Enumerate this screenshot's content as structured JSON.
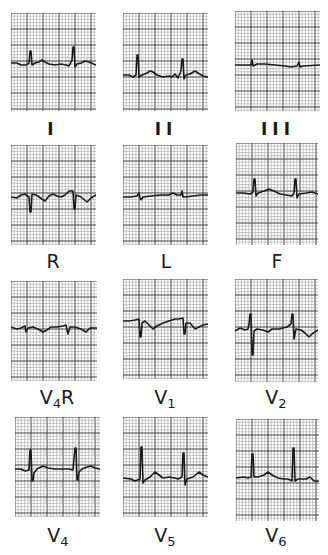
{
  "chart_data": {
    "type": "line",
    "title": "",
    "grid": {
      "on": true,
      "major_every_px": 16,
      "minor_divisions": 5,
      "paper_color": "#ffffff",
      "line_color": "#555555"
    },
    "layout": {
      "columns": 3,
      "rows": 4
    },
    "leads": [
      {
        "id": "I",
        "label": "I",
        "label_main": "I",
        "label_sub": "",
        "label_tail": "",
        "box": [
          11,
          13,
          85,
          98
        ],
        "baseline": 50,
        "trace": [
          [
            0,
            50
          ],
          [
            6,
            50
          ],
          [
            10,
            52
          ],
          [
            15,
            52
          ],
          [
            18,
            50
          ],
          [
            19,
            38
          ],
          [
            20,
            38
          ],
          [
            21,
            52
          ],
          [
            24,
            50
          ],
          [
            28,
            49
          ],
          [
            31,
            47
          ],
          [
            34,
            49
          ],
          [
            38,
            51
          ],
          [
            44,
            52
          ],
          [
            50,
            51
          ],
          [
            55,
            52
          ],
          [
            58,
            53
          ],
          [
            61,
            47
          ],
          [
            62,
            34
          ],
          [
            63,
            34
          ],
          [
            64,
            54
          ],
          [
            66,
            51
          ],
          [
            70,
            50
          ],
          [
            74,
            48
          ],
          [
            78,
            49
          ],
          [
            85,
            52
          ]
        ]
      },
      {
        "id": "II",
        "label": "II",
        "label_main": "II",
        "label_sub": "",
        "label_tail": "",
        "box": [
          123,
          13,
          85,
          98
        ],
        "baseline": 58,
        "trace": [
          [
            0,
            62
          ],
          [
            6,
            62
          ],
          [
            10,
            64
          ],
          [
            13,
            62
          ],
          [
            14,
            42
          ],
          [
            15,
            42
          ],
          [
            16,
            64
          ],
          [
            19,
            62
          ],
          [
            24,
            60
          ],
          [
            27,
            58
          ],
          [
            30,
            59
          ],
          [
            34,
            62
          ],
          [
            40,
            64
          ],
          [
            46,
            63
          ],
          [
            49,
            64
          ],
          [
            52,
            61
          ],
          [
            55,
            65
          ],
          [
            58,
            58
          ],
          [
            59,
            46
          ],
          [
            60,
            46
          ],
          [
            61,
            66
          ],
          [
            63,
            62
          ],
          [
            67,
            61
          ],
          [
            72,
            58
          ],
          [
            75,
            60
          ],
          [
            80,
            63
          ],
          [
            85,
            64
          ]
        ]
      },
      {
        "id": "III",
        "label": "III",
        "label_main": "III",
        "label_sub": "",
        "label_tail": "",
        "box": [
          235,
          11,
          85,
          100
        ],
        "baseline": 54,
        "trace": [
          [
            0,
            54
          ],
          [
            12,
            54
          ],
          [
            16,
            54
          ],
          [
            17,
            49
          ],
          [
            18,
            55
          ],
          [
            22,
            53
          ],
          [
            30,
            53
          ],
          [
            40,
            54
          ],
          [
            50,
            55
          ],
          [
            56,
            56
          ],
          [
            62,
            55
          ],
          [
            64,
            51
          ],
          [
            65,
            56
          ],
          [
            68,
            55
          ],
          [
            85,
            54
          ]
        ]
      },
      {
        "id": "R",
        "label": "R",
        "label_main": "R",
        "label_sub": "",
        "label_tail": "",
        "box": [
          11,
          145,
          85,
          100
        ],
        "baseline": 52,
        "trace": [
          [
            0,
            52
          ],
          [
            6,
            53
          ],
          [
            10,
            50
          ],
          [
            14,
            49
          ],
          [
            18,
            52
          ],
          [
            19,
            67
          ],
          [
            20,
            67
          ],
          [
            21,
            49
          ],
          [
            25,
            50
          ],
          [
            28,
            52
          ],
          [
            34,
            56
          ],
          [
            38,
            51
          ],
          [
            42,
            49
          ],
          [
            46,
            51
          ],
          [
            50,
            52
          ],
          [
            54,
            50
          ],
          [
            58,
            46
          ],
          [
            62,
            46
          ],
          [
            63,
            64
          ],
          [
            64,
            64
          ],
          [
            65,
            50
          ],
          [
            70,
            52
          ],
          [
            76,
            57
          ],
          [
            80,
            53
          ],
          [
            85,
            50
          ]
        ]
      },
      {
        "id": "L",
        "label": "L",
        "label_main": "L",
        "label_sub": "",
        "label_tail": "",
        "box": [
          123,
          145,
          85,
          100
        ],
        "baseline": 51,
        "trace": [
          [
            0,
            52
          ],
          [
            8,
            52
          ],
          [
            14,
            51
          ],
          [
            16,
            48
          ],
          [
            17,
            53
          ],
          [
            18,
            55
          ],
          [
            20,
            52
          ],
          [
            28,
            51
          ],
          [
            38,
            50
          ],
          [
            46,
            50
          ],
          [
            50,
            48
          ],
          [
            54,
            50
          ],
          [
            58,
            50
          ],
          [
            59,
            46
          ],
          [
            60,
            52
          ],
          [
            62,
            52
          ],
          [
            70,
            51
          ],
          [
            78,
            50
          ],
          [
            85,
            50
          ]
        ]
      },
      {
        "id": "F",
        "label": "F",
        "label_main": "F",
        "label_sub": "",
        "label_tail": "",
        "box": [
          236,
          143,
          82,
          102
        ],
        "baseline": 50,
        "trace": [
          [
            0,
            50
          ],
          [
            8,
            50
          ],
          [
            14,
            51
          ],
          [
            17,
            49
          ],
          [
            18,
            36
          ],
          [
            19,
            36
          ],
          [
            20,
            53
          ],
          [
            22,
            50
          ],
          [
            28,
            48
          ],
          [
            33,
            46
          ],
          [
            38,
            48
          ],
          [
            44,
            51
          ],
          [
            50,
            52
          ],
          [
            56,
            53
          ],
          [
            58,
            50
          ],
          [
            59,
            36
          ],
          [
            60,
            36
          ],
          [
            61,
            55
          ],
          [
            63,
            51
          ],
          [
            70,
            50
          ],
          [
            76,
            49
          ],
          [
            82,
            51
          ]
        ]
      },
      {
        "id": "V4R",
        "label": "V4R",
        "label_main": "V",
        "label_sub": "4",
        "label_tail": "R",
        "box": [
          11,
          281,
          86,
          100
        ],
        "baseline": 46,
        "trace": [
          [
            0,
            46
          ],
          [
            6,
            48
          ],
          [
            10,
            47
          ],
          [
            14,
            45
          ],
          [
            15,
            51
          ],
          [
            17,
            47
          ],
          [
            22,
            46
          ],
          [
            27,
            48
          ],
          [
            32,
            51
          ],
          [
            36,
            49
          ],
          [
            40,
            46
          ],
          [
            46,
            46
          ],
          [
            52,
            45
          ],
          [
            55,
            44
          ],
          [
            57,
            53
          ],
          [
            59,
            46
          ],
          [
            64,
            46
          ],
          [
            70,
            48
          ],
          [
            75,
            51
          ],
          [
            79,
            47
          ],
          [
            86,
            47
          ]
        ]
      },
      {
        "id": "V1",
        "label": "V1",
        "label_main": "V",
        "label_sub": "1",
        "label_tail": "",
        "box": [
          123,
          279,
          85,
          100
        ],
        "baseline": 40,
        "trace": [
          [
            0,
            42
          ],
          [
            6,
            42
          ],
          [
            12,
            41
          ],
          [
            16,
            40
          ],
          [
            17,
            58
          ],
          [
            18,
            58
          ],
          [
            19,
            44
          ],
          [
            22,
            42
          ],
          [
            26,
            46
          ],
          [
            30,
            50
          ],
          [
            34,
            47
          ],
          [
            40,
            44
          ],
          [
            46,
            42
          ],
          [
            52,
            40
          ],
          [
            56,
            40
          ],
          [
            60,
            39
          ],
          [
            61,
            55
          ],
          [
            62,
            55
          ],
          [
            63,
            44
          ],
          [
            67,
            44
          ],
          [
            72,
            50
          ],
          [
            76,
            48
          ],
          [
            80,
            46
          ],
          [
            85,
            45
          ]
        ]
      },
      {
        "id": "V2",
        "label": "V2",
        "label_main": "V",
        "label_sub": "2",
        "label_tail": "",
        "box": [
          235,
          279,
          83,
          103
        ],
        "baseline": 50,
        "trace": [
          [
            0,
            52
          ],
          [
            5,
            49
          ],
          [
            10,
            51
          ],
          [
            13,
            50
          ],
          [
            14,
            45
          ],
          [
            15,
            35
          ],
          [
            16,
            35
          ],
          [
            17,
            76
          ],
          [
            18,
            76
          ],
          [
            19,
            52
          ],
          [
            22,
            50
          ],
          [
            28,
            51
          ],
          [
            33,
            53
          ],
          [
            37,
            50
          ],
          [
            44,
            50
          ],
          [
            52,
            48
          ],
          [
            56,
            45
          ],
          [
            57,
            35
          ],
          [
            58,
            35
          ],
          [
            59,
            60
          ],
          [
            61,
            50
          ],
          [
            66,
            51
          ],
          [
            70,
            54
          ],
          [
            74,
            58
          ],
          [
            77,
            55
          ],
          [
            83,
            51
          ]
        ]
      },
      {
        "id": "V4",
        "label": "V4",
        "label_main": "V",
        "label_sub": "4",
        "label_tail": "",
        "box": [
          15,
          417,
          85,
          100
        ],
        "baseline": 51,
        "trace": [
          [
            0,
            52
          ],
          [
            6,
            52
          ],
          [
            10,
            54
          ],
          [
            14,
            53
          ],
          [
            15,
            33
          ],
          [
            16,
            33
          ],
          [
            17,
            64
          ],
          [
            18,
            64
          ],
          [
            19,
            56
          ],
          [
            22,
            52
          ],
          [
            28,
            49
          ],
          [
            33,
            51
          ],
          [
            40,
            52
          ],
          [
            48,
            52
          ],
          [
            54,
            52
          ],
          [
            58,
            53
          ],
          [
            60,
            31
          ],
          [
            61,
            31
          ],
          [
            62,
            63
          ],
          [
            63,
            63
          ],
          [
            64,
            55
          ],
          [
            67,
            52
          ],
          [
            72,
            50
          ],
          [
            76,
            49
          ],
          [
            80,
            51
          ],
          [
            85,
            52
          ]
        ]
      },
      {
        "id": "V5",
        "label": "V5",
        "label_main": "V",
        "label_sub": "5",
        "label_tail": "",
        "box": [
          123,
          417,
          85,
          100
        ],
        "baseline": 60,
        "trace": [
          [
            0,
            61
          ],
          [
            8,
            62
          ],
          [
            12,
            64
          ],
          [
            17,
            62
          ],
          [
            18,
            30
          ],
          [
            19,
            30
          ],
          [
            20,
            66
          ],
          [
            22,
            63
          ],
          [
            27,
            60
          ],
          [
            32,
            55
          ],
          [
            36,
            58
          ],
          [
            40,
            61
          ],
          [
            46,
            60
          ],
          [
            52,
            61
          ],
          [
            55,
            62
          ],
          [
            59,
            60
          ],
          [
            60,
            36
          ],
          [
            61,
            36
          ],
          [
            62,
            68
          ],
          [
            64,
            62
          ],
          [
            70,
            60
          ],
          [
            76,
            55
          ],
          [
            80,
            58
          ],
          [
            85,
            60
          ]
        ]
      },
      {
        "id": "V6",
        "label": "V6",
        "label_main": "V",
        "label_sub": "6",
        "label_tail": "",
        "box": [
          236,
          419,
          83,
          102
        ],
        "baseline": 58,
        "trace": [
          [
            0,
            59
          ],
          [
            8,
            58
          ],
          [
            12,
            59
          ],
          [
            15,
            58
          ],
          [
            16,
            35
          ],
          [
            17,
            35
          ],
          [
            18,
            58
          ],
          [
            22,
            58
          ],
          [
            28,
            56
          ],
          [
            32,
            53
          ],
          [
            36,
            56
          ],
          [
            42,
            59
          ],
          [
            48,
            60
          ],
          [
            52,
            60
          ],
          [
            56,
            62
          ],
          [
            57,
            29
          ],
          [
            58,
            29
          ],
          [
            59,
            62
          ],
          [
            62,
            60
          ],
          [
            70,
            60
          ],
          [
            74,
            58
          ],
          [
            78,
            62
          ],
          [
            83,
            62
          ]
        ]
      }
    ],
    "label_positions": {
      "I": [
        53,
        137
      ],
      "II": [
        166,
        137
      ],
      "III": [
        278,
        137
      ],
      "R": [
        53,
        270
      ],
      "L": [
        166,
        270
      ],
      "F": [
        277,
        270
      ],
      "V4R": [
        57,
        406
      ],
      "V1": [
        165,
        406
      ],
      "V2": [
        276,
        406
      ],
      "V4": [
        58,
        544
      ],
      "V5": [
        165,
        544
      ],
      "V6": [
        276,
        544
      ]
    }
  },
  "colors": {
    "trace": "#1c1c1c",
    "grid_minor": "#8a8a8a",
    "grid_major": "#2e2e2e",
    "label": "#1a1a1a"
  }
}
